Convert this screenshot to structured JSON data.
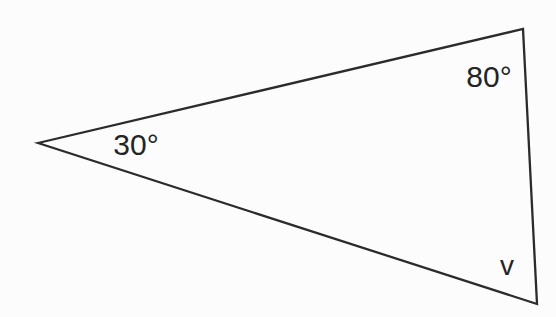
{
  "figure": {
    "type": "triangle-diagram",
    "background": "#fcfcfc",
    "stroke_color": "#2b2b2b",
    "stroke_width": "2.3",
    "polygon_points": "38,143 523,29 537,304",
    "vertices": {
      "left": {
        "x": 38,
        "y": 143,
        "angle_label": "30°"
      },
      "top_right": {
        "x": 523,
        "y": 29,
        "angle_label": "80°"
      },
      "bottom_right": {
        "x": 537,
        "y": 304,
        "angle_label": "v"
      }
    },
    "labels": {
      "left_angle": {
        "text": "30°",
        "x": 136,
        "y": 155
      },
      "top_right_angle": {
        "text": "80°",
        "x": 489,
        "y": 87
      },
      "bottom_right_angle": {
        "text": "v",
        "x": 507,
        "y": 275
      }
    }
  }
}
